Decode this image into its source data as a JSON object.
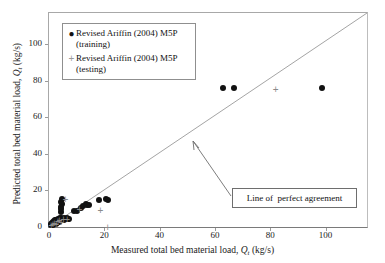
{
  "chart_data": {
    "type": "scatter",
    "title": "",
    "xlabel": "Measured total bed material load, Qt (kg/s)",
    "ylabel": "Predicted total bed material load, Qt (kg/s)",
    "xticks": [
      0,
      20,
      40,
      60,
      80,
      100
    ],
    "yticks": [
      0,
      20,
      40,
      60,
      80,
      100
    ],
    "xlim": [
      0,
      115
    ],
    "ylim": [
      0,
      117
    ],
    "grid": false,
    "legend_position": "upper-left-inside",
    "series": [
      {
        "name": "Revised Ariffin (2004) M5P (training)",
        "marker": "filled-circle",
        "color": "#111111",
        "points": [
          [
            0.6,
            1.2
          ],
          [
            0.9,
            1.6
          ],
          [
            1.1,
            2.2
          ],
          [
            1.3,
            1.0
          ],
          [
            1.5,
            2.8
          ],
          [
            1.7,
            1.8
          ],
          [
            1.9,
            3.2
          ],
          [
            2.1,
            2.4
          ],
          [
            2.3,
            3.6
          ],
          [
            2.5,
            1.4
          ],
          [
            2.7,
            4.0
          ],
          [
            2.9,
            2.0
          ],
          [
            3.1,
            3.0
          ],
          [
            3.3,
            4.4
          ],
          [
            3.5,
            2.6
          ],
          [
            3.7,
            3.8
          ],
          [
            3.9,
            4.8
          ],
          [
            4.1,
            3.4
          ],
          [
            4.3,
            4.2
          ],
          [
            4.5,
            5.0
          ],
          [
            4.7,
            3.6
          ],
          [
            5.0,
            4.6
          ],
          [
            5.3,
            4.0
          ],
          [
            5.6,
            4.9
          ],
          [
            6.0,
            4.3
          ],
          [
            6.4,
            4.7
          ],
          [
            6.9,
            4.5
          ],
          [
            7.4,
            4.6
          ],
          [
            4.2,
            8.4
          ],
          [
            4.4,
            9.6
          ],
          [
            4.5,
            11.0
          ],
          [
            4.6,
            12.4
          ],
          [
            4.3,
            13.6
          ],
          [
            4.8,
            15.2
          ],
          [
            9.2,
            8.6
          ],
          [
            10.2,
            9.0
          ],
          [
            11.4,
            10.6
          ],
          [
            12.3,
            11.4
          ],
          [
            13.2,
            12.6
          ],
          [
            13.8,
            11.8
          ],
          [
            14.6,
            12.2
          ],
          [
            18.2,
            14.6
          ],
          [
            20.6,
            15.2
          ],
          [
            21.4,
            15.0
          ],
          [
            62.8,
            76.0
          ],
          [
            67.0,
            76.0
          ],
          [
            98.8,
            76.0
          ]
        ]
      },
      {
        "name": "Revised Ariffin (2004) M5P (testing)",
        "marker": "plus",
        "color": "#8a8a8a",
        "points": [
          [
            0.8,
            0.9
          ],
          [
            1.4,
            1.5
          ],
          [
            2.0,
            2.1
          ],
          [
            2.6,
            1.3
          ],
          [
            3.2,
            2.8
          ],
          [
            3.8,
            3.4
          ],
          [
            4.4,
            2.2
          ],
          [
            5.2,
            4.1
          ],
          [
            5.9,
            15.2
          ],
          [
            6.6,
            3.9
          ],
          [
            11.0,
            9.4
          ],
          [
            18.6,
            9.0
          ],
          [
            21.2,
            0.0
          ],
          [
            82.0,
            75.4
          ]
        ]
      }
    ],
    "reference_line": {
      "label": "Line of  perfect agreement",
      "type": "one-to-one",
      "from": [
        0,
        0
      ],
      "to": [
        115,
        115
      ]
    }
  },
  "legend": {
    "items": [
      {
        "key": "filled-circle",
        "line1": "Revised Ariffin (2004) M5P",
        "line2": "(training)"
      },
      {
        "key": "plus",
        "line1": "Revised Ariffin (2004) M5P",
        "line2": "(testing)"
      }
    ]
  },
  "annotation": {
    "label": "Line of  perfect agreement"
  },
  "axes": {
    "x": {
      "label_prefix": "Measured total bed material load, ",
      "label_symbol": "Q",
      "label_sub": "t",
      "label_suffix": " (kg/s)",
      "ticks": [
        "0",
        "20",
        "40",
        "60",
        "80",
        "100"
      ]
    },
    "y": {
      "label_prefix": "Predicted total bed material load, ",
      "label_symbol": "Q",
      "label_sub": "t",
      "label_suffix": " (kg/s)",
      "ticks": [
        "20",
        "40",
        "60",
        "80",
        "100"
      ],
      "zero_tick": "0"
    }
  },
  "colors": {
    "training_marker": "#111111",
    "testing_marker": "#8a8a8a",
    "frame": "#a8a8a8",
    "reference_line": "#9a9a9a"
  }
}
